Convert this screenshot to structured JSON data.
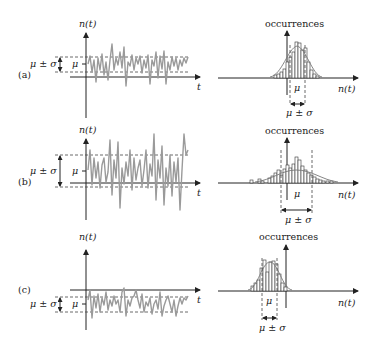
{
  "figure": {
    "panels": [
      {
        "id": "a",
        "label": "(a)",
        "time_plot": {
          "y_axis_label": "n(t)",
          "x_axis_label": "t",
          "mean_label": "μ",
          "spread_label": "μ ± σ",
          "description": "small-variance signal fluctuating slightly above the time axis"
        },
        "histogram": {
          "y_axis_label": "occurrences",
          "x_axis_label": "n(t)",
          "mean_label": "μ",
          "spread_label": "μ ± σ",
          "description": "narrow distribution centered just right of the vertical axis"
        }
      },
      {
        "id": "b",
        "label": "(b)",
        "time_plot": {
          "y_axis_label": "n(t)",
          "x_axis_label": "t",
          "mean_label": "μ",
          "spread_label": "μ ± σ",
          "description": "large-variance signal with mean above the time axis"
        },
        "histogram": {
          "y_axis_label": "occurrences",
          "x_axis_label": "n(t)",
          "mean_label": "μ",
          "spread_label": "μ ± σ",
          "description": "wide distribution with long tails"
        }
      },
      {
        "id": "c",
        "label": "(c)",
        "time_plot": {
          "y_axis_label": "n(t)",
          "x_axis_label": "t",
          "mean_label": "μ",
          "spread_label": "μ ± σ",
          "description": "small-variance signal with negative mean, below the time axis"
        },
        "histogram": {
          "y_axis_label": "occurrences",
          "x_axis_label": "n(t)",
          "mean_label": "μ",
          "spread_label": "μ ± σ",
          "description": "narrow distribution centered left of the vertical axis"
        }
      }
    ]
  }
}
